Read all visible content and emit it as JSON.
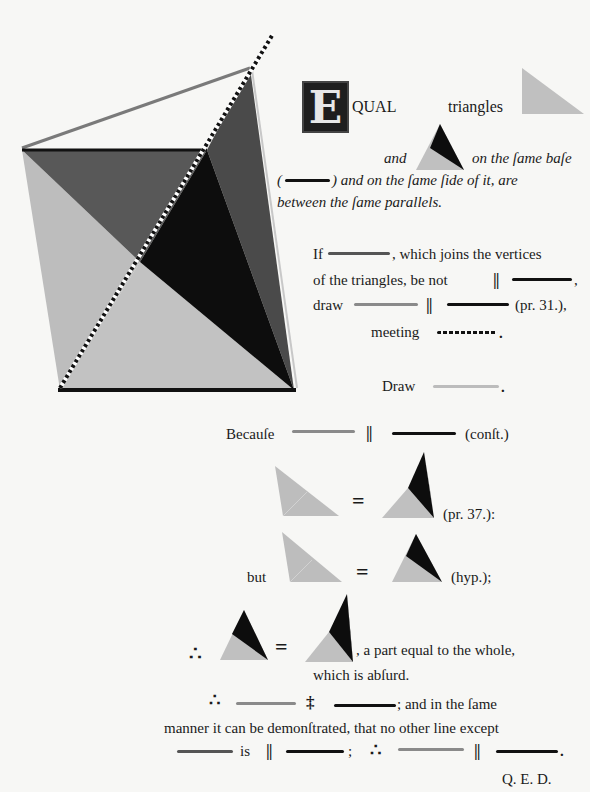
{
  "page": {
    "background": "#f7f7f5",
    "colors": {
      "black": "#111111",
      "dark_gray": "#555555",
      "mid_gray": "#8a8a8a",
      "light_gray": "#bfbfbf"
    }
  },
  "figure": {
    "name": "main-diagram",
    "vertices": {
      "top_left": [
        22,
        150
      ],
      "apex": [
        250,
        68
      ],
      "mid_right": [
        207,
        150
      ],
      "bottom_left": [
        60,
        390
      ],
      "bottom_right": [
        294,
        390
      ]
    },
    "dotted_line_end": [
      272,
      35
    ]
  },
  "enunciation": {
    "dropcap": "E",
    "word1": "QUAL",
    "word2": "triangles",
    "line2_text": "and",
    "line2_tail": "on the ſame baſe",
    "line3_open": "(",
    "line3_tail": ") and on the ſame ſide of it, are",
    "line4": "between the ſame parallels."
  },
  "proof": {
    "if_prefix": "If",
    "if_tail": ", which joins the vertices",
    "line2_text": "of the triangles, be not",
    "line2_end": ",",
    "draw_prefix": "draw",
    "draw_ref": "(pr. 31.),",
    "meeting": "meeting",
    "meeting_end": ".",
    "draw2": "Draw",
    "draw2_end": ".",
    "because": "Becauſe",
    "because_ref": "(conſt.)",
    "eq_ref1": "(pr. 37.):",
    "but": "but",
    "eq_ref2": "(hyp.);",
    "therefore": "∴",
    "absurd1": ", a part equal to the whole,",
    "absurd2": "which is abſurd.",
    "concl1_tail": "; and in the ſame",
    "concl2": "manner it can be demonſtrated, that no other line except",
    "concl3_is": "is",
    "concl3_semicolon": ";",
    "concl3_end": ".",
    "qed": "Q. E. D.",
    "parallel": "||",
    "not_parallel": "‡",
    "equals": "="
  }
}
